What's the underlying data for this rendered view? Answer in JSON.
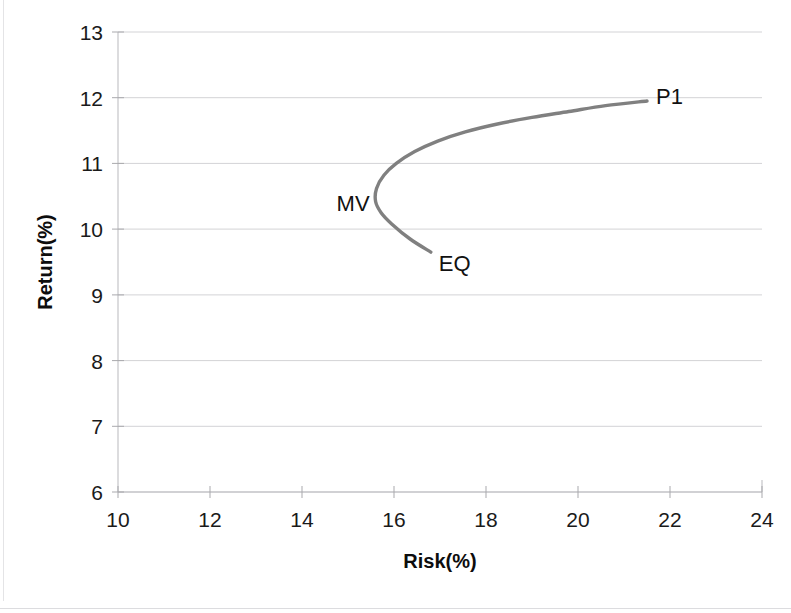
{
  "chart_data": {
    "type": "line",
    "title": "",
    "xlabel": "Risk(%)",
    "ylabel": "Return(%)",
    "xlim": [
      10,
      24
    ],
    "ylim": [
      6,
      13
    ],
    "xticks": [
      10,
      12,
      14,
      16,
      18,
      20,
      22,
      24
    ],
    "yticks": [
      6,
      7,
      8,
      9,
      10,
      11,
      12,
      13
    ],
    "xtick_labels": [
      "10",
      "12",
      "14",
      "16",
      "18",
      "20",
      "22",
      "24"
    ],
    "ytick_labels": [
      "6",
      "7",
      "8",
      "9",
      "10",
      "11",
      "12",
      "13"
    ],
    "grid": "horizontal",
    "legend": "none",
    "series": [
      {
        "name": "Efficient frontier",
        "color": "#808080",
        "x": [
          16.8,
          16.35,
          15.95,
          15.72,
          15.6,
          15.62,
          15.78,
          16.05,
          16.45,
          16.95,
          17.55,
          18.25,
          19.0,
          19.8,
          20.6,
          21.5
        ],
        "y": [
          9.65,
          9.85,
          10.08,
          10.25,
          10.42,
          10.62,
          10.82,
          11.0,
          11.18,
          11.34,
          11.48,
          11.6,
          11.7,
          11.79,
          11.88,
          11.95
        ]
      }
    ],
    "annotations": [
      {
        "text": "MV",
        "x": 15.6,
        "y": 10.42,
        "label_position": "left",
        "meaning": "minimum-variance-portfolio"
      },
      {
        "text": "EQ",
        "x": 16.8,
        "y": 9.65,
        "label_position": "right",
        "meaning": "equally-weighted-portfolio"
      },
      {
        "text": "P1",
        "x": 21.5,
        "y": 11.95,
        "label_position": "right",
        "meaning": "portfolio-one"
      }
    ]
  },
  "colors": {
    "curve": "#808080",
    "gridline": "#d3d3d6",
    "axis": "#b9b9bd",
    "text": "#1a1a1a",
    "background": "#ffffff"
  }
}
